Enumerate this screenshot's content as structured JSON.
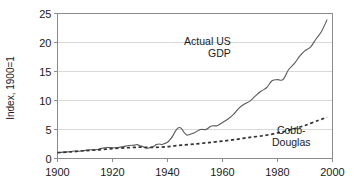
{
  "chart_data": {
    "type": "line",
    "title": "",
    "xlabel": "",
    "ylabel": "Index, 1900=1",
    "xlim": [
      1900,
      2000
    ],
    "ylim": [
      0,
      25
    ],
    "xticks": [
      1900,
      1920,
      1940,
      1960,
      1980,
      2000
    ],
    "yticks": [
      0,
      5,
      10,
      15,
      20,
      25
    ],
    "xtick_labels": [
      "1900",
      "1920",
      "1940",
      "1960",
      "1980",
      "2000"
    ],
    "ytick_labels": [
      "0",
      "5",
      "10",
      "15",
      "20",
      "25"
    ],
    "grid": "horizontal",
    "legend": "inline-annotations",
    "annotations": [
      {
        "id": "actual-us-gdp",
        "lines": [
          "Actual US",
          "GDP"
        ],
        "x": 1963,
        "y": 19.6,
        "align": "end"
      },
      {
        "id": "cobb-douglas",
        "lines": [
          "Cobb-",
          "Douglas"
        ],
        "x": 1985,
        "y": 4.3,
        "align": "middle"
      }
    ],
    "series": [
      {
        "name": "Actual US GDP",
        "style": "solid",
        "color": "#5a5a5a",
        "x": [
          1900,
          1902,
          1904,
          1906,
          1908,
          1910,
          1912,
          1914,
          1916,
          1918,
          1920,
          1922,
          1924,
          1926,
          1928,
          1929,
          1930,
          1931,
          1932,
          1933,
          1934,
          1935,
          1936,
          1937,
          1938,
          1939,
          1940,
          1941,
          1942,
          1943,
          1944,
          1945,
          1946,
          1947,
          1948,
          1950,
          1952,
          1954,
          1956,
          1958,
          1960,
          1962,
          1964,
          1966,
          1968,
          1970,
          1972,
          1974,
          1976,
          1978,
          1980,
          1982,
          1984,
          1986,
          1988,
          1990,
          1992,
          1994,
          1996,
          1998
        ],
        "values": [
          1.0,
          1.1,
          1.15,
          1.3,
          1.25,
          1.4,
          1.5,
          1.5,
          1.75,
          1.9,
          1.85,
          1.9,
          2.05,
          2.25,
          2.3,
          2.4,
          2.2,
          2.05,
          1.8,
          1.78,
          1.95,
          2.1,
          2.4,
          2.5,
          2.4,
          2.6,
          2.8,
          3.3,
          3.95,
          4.8,
          5.3,
          5.2,
          4.5,
          4.05,
          4.15,
          4.5,
          5.0,
          5.0,
          5.6,
          5.65,
          6.2,
          6.8,
          7.6,
          8.7,
          9.4,
          9.9,
          10.8,
          11.6,
          12.2,
          13.4,
          13.6,
          13.6,
          15.3,
          16.3,
          17.6,
          18.6,
          19.2,
          20.6,
          21.9,
          23.9
        ]
      },
      {
        "name": "Cobb-Douglas",
        "style": "dashed",
        "color": "#333333",
        "x": [
          1900,
          1905,
          1910,
          1915,
          1920,
          1925,
          1930,
          1935,
          1940,
          1945,
          1950,
          1955,
          1960,
          1965,
          1970,
          1975,
          1980,
          1985,
          1990,
          1995,
          1998
        ],
        "values": [
          1.0,
          1.15,
          1.35,
          1.5,
          1.7,
          1.85,
          1.95,
          1.9,
          2.05,
          2.3,
          2.5,
          2.75,
          3.0,
          3.3,
          3.65,
          3.95,
          4.4,
          5.0,
          5.7,
          6.6,
          7.1
        ]
      }
    ]
  },
  "axes": {
    "y_axis_title": "Index, 1900=1"
  }
}
